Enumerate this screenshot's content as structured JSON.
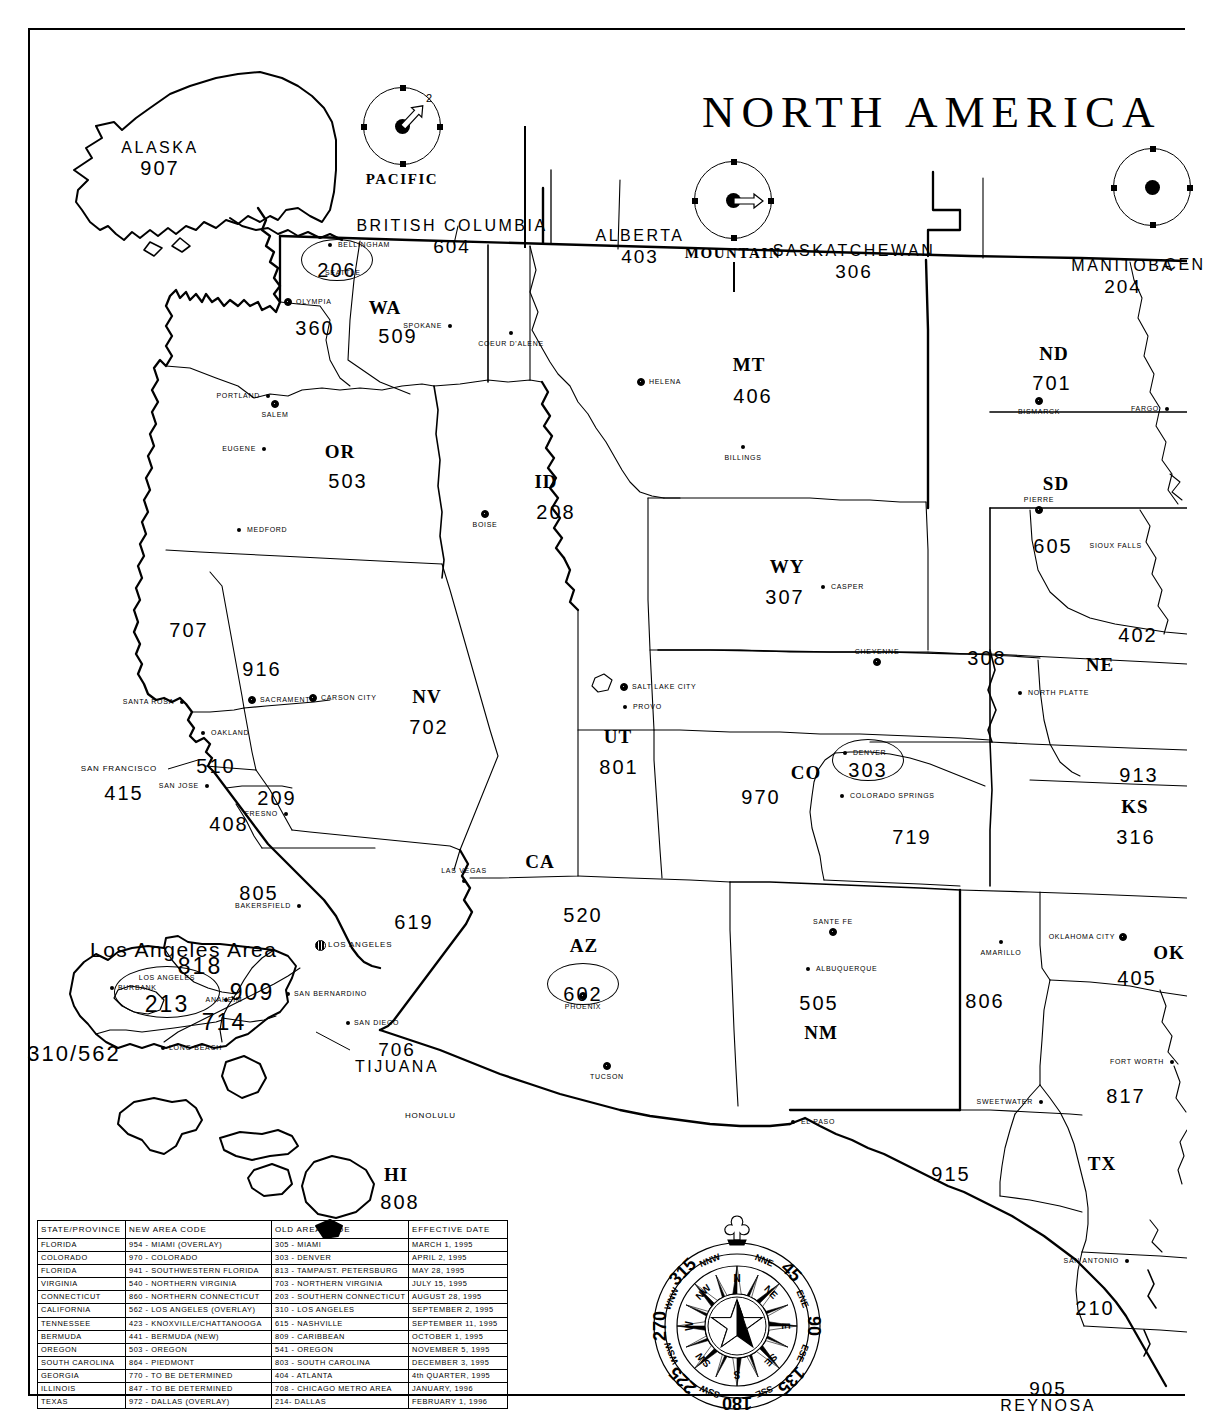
{
  "title": "NORTH AMERICA",
  "inset": {
    "title": "Los Angeles Area",
    "codes": [
      {
        "code": "818",
        "x": 170,
        "y": 924
      },
      {
        "code": "909",
        "x": 222,
        "y": 950
      },
      {
        "code": "213",
        "x": 137,
        "y": 962,
        "label": "LOS ANGELES"
      },
      {
        "code": "714",
        "x": 194,
        "y": 980,
        "label": "ANAHEIM"
      },
      {
        "code": "310/562",
        "x": 44,
        "y": 1012
      }
    ],
    "cities": [
      "BURBANK",
      "LOS ANGELES",
      "LONG BEACH",
      "ANAHEIM",
      "SAN BERNARDINO",
      "SAN DIEGO"
    ]
  },
  "timezones": [
    {
      "name": "PACIFIC",
      "hand": "2",
      "angle": -50
    },
    {
      "name": "MOUNTAIN",
      "hand": "",
      "angle": 0
    },
    {
      "name": "CENTRAL",
      "hand": "",
      "angle": 0
    }
  ],
  "compass": {
    "degrees": [
      "45",
      "90",
      "135",
      "180",
      "225",
      "270",
      "315"
    ],
    "cardinals": [
      "N",
      "NE",
      "E",
      "SE",
      "S",
      "SW",
      "W",
      "NW"
    ],
    "intercardinals": [
      "NNE",
      "ENE",
      "ESE",
      "SSE",
      "SSW",
      "WSW",
      "WNW",
      "NNW"
    ]
  },
  "states": [
    {
      "abbr": "WA",
      "code": "509",
      "ax": 355,
      "ay": 268,
      "cx": 368,
      "cy": 296
    },
    {
      "abbr": "",
      "code": "360",
      "cx": 285,
      "cy": 288
    },
    {
      "abbr": "",
      "code": "206",
      "cx": 307,
      "cy": 230,
      "oval": true,
      "label": "SEATTLE"
    },
    {
      "abbr": "OR",
      "code": "503",
      "ax": 310,
      "ay": 412,
      "cx": 318,
      "cy": 441
    },
    {
      "abbr": "ID",
      "code": "208",
      "ax": 516,
      "ay": 442,
      "cx": 526,
      "cy": 472
    },
    {
      "abbr": "MT",
      "code": "406",
      "ax": 719,
      "ay": 325,
      "cx": 723,
      "cy": 356
    },
    {
      "abbr": "WY",
      "code": "307",
      "ax": 757,
      "ay": 527,
      "cx": 755,
      "cy": 557
    },
    {
      "abbr": "ND",
      "code": "701",
      "ax": 1024,
      "ay": 314,
      "cx": 1022,
      "cy": 343
    },
    {
      "abbr": "SD",
      "code": "605",
      "ax": 1026,
      "ay": 444,
      "cx": 1023,
      "cy": 506
    },
    {
      "abbr": "NE",
      "code": "402",
      "ax": 1070,
      "ay": 625,
      "cx": 1108,
      "cy": 595
    },
    {
      "abbr": "",
      "code": "308",
      "cx": 957,
      "cy": 618
    },
    {
      "abbr": "KS",
      "code": "316",
      "ax": 1105,
      "ay": 767,
      "cx": 1106,
      "cy": 797
    },
    {
      "abbr": "",
      "code": "913",
      "cx": 1109,
      "cy": 735
    },
    {
      "abbr": "NV",
      "code": "702",
      "ax": 397,
      "ay": 657,
      "cx": 399,
      "cy": 687
    },
    {
      "abbr": "UT",
      "code": "801",
      "ax": 588,
      "ay": 697,
      "cx": 589,
      "cy": 727
    },
    {
      "abbr": "CO",
      "code": "303",
      "ax": 776,
      "ay": 733,
      "cx": 838,
      "cy": 730,
      "oval": true,
      "label": "DENVER"
    },
    {
      "abbr": "",
      "code": "970",
      "cx": 731,
      "cy": 757
    },
    {
      "abbr": "",
      "code": "719",
      "cx": 882,
      "cy": 797
    },
    {
      "abbr": "CA",
      "code": "",
      "ax": 510,
      "ay": 822
    },
    {
      "abbr": "",
      "code": "707",
      "cx": 159,
      "cy": 590
    },
    {
      "abbr": "",
      "code": "916",
      "cx": 232,
      "cy": 629
    },
    {
      "abbr": "",
      "code": "510",
      "cx": 186,
      "cy": 726
    },
    {
      "abbr": "",
      "code": "415",
      "cx": 94,
      "cy": 753
    },
    {
      "abbr": "",
      "code": "408",
      "cx": 199,
      "cy": 784
    },
    {
      "abbr": "",
      "code": "209",
      "cx": 247,
      "cy": 758
    },
    {
      "abbr": "",
      "code": "805",
      "cx": 229,
      "cy": 853
    },
    {
      "abbr": "",
      "code": "619",
      "cx": 384,
      "cy": 882
    },
    {
      "abbr": "AZ",
      "code": "520",
      "ax": 554,
      "ay": 906,
      "cx": 553,
      "cy": 875
    },
    {
      "abbr": "",
      "code": "602",
      "cx": 553,
      "cy": 954,
      "oval": true,
      "label": "PHOENIX"
    },
    {
      "abbr": "NM",
      "code": "505",
      "ax": 791,
      "ay": 993,
      "cx": 789,
      "cy": 963
    },
    {
      "abbr": "OK",
      "code": "405",
      "ax": 1139,
      "ay": 913,
      "cx": 1107,
      "cy": 938
    },
    {
      "abbr": "TX",
      "code": "817",
      "ax": 1072,
      "ay": 1124,
      "cx": 1096,
      "cy": 1056
    },
    {
      "abbr": "",
      "code": "806",
      "cx": 955,
      "cy": 961
    },
    {
      "abbr": "",
      "code": "915",
      "cx": 921,
      "cy": 1134
    },
    {
      "abbr": "",
      "code": "210",
      "cx": 1065,
      "cy": 1268
    },
    {
      "abbr": "HI",
      "code": "808",
      "ax": 366,
      "ay": 1135,
      "cx": 370,
      "cy": 1162
    },
    {
      "abbr": "",
      "code": "907",
      "cx": 130,
      "cy": 128,
      "statename": "ALASKA"
    }
  ],
  "provinces": [
    {
      "name": "BRITISH COLUMBIA",
      "code": "604",
      "x": 422,
      "y": 188
    },
    {
      "name": "ALBERTA",
      "code": "403",
      "x": 610,
      "y": 198
    },
    {
      "name": "SASKATCHEWAN",
      "code": "306",
      "x": 824,
      "y": 213
    },
    {
      "name": "MANITOBA",
      "code": "204",
      "x": 1093,
      "y": 228
    }
  ],
  "regions": [
    {
      "name": "ALASKA",
      "code": "907",
      "x": 130,
      "y": 110
    },
    {
      "name": "TIJUANA",
      "code": "706",
      "x": 367,
      "y": 1010
    },
    {
      "name": "REYNOSA",
      "code": "905",
      "x": 1018,
      "y": 1349
    },
    {
      "name": "CEN",
      "code": "",
      "x": 1155,
      "y": 227
    }
  ],
  "cities": [
    {
      "name": "BELLINGHAM",
      "x": 300,
      "y": 215,
      "type": "dot",
      "side": "right"
    },
    {
      "name": "SEATTLE",
      "x": 287,
      "y": 243,
      "type": "none",
      "side": "right"
    },
    {
      "name": "OLYMPIA",
      "x": 258,
      "y": 272,
      "type": "cap",
      "side": "right"
    },
    {
      "name": "SPOKANE",
      "x": 420,
      "y": 296,
      "type": "dot",
      "side": "left"
    },
    {
      "name": "COEUR D'ALENE",
      "x": 481,
      "y": 303,
      "type": "dot",
      "side": "below"
    },
    {
      "name": "PORTLAND",
      "x": 238,
      "y": 366,
      "type": "dot",
      "side": "left"
    },
    {
      "name": "SALEM",
      "x": 245,
      "y": 374,
      "type": "cap",
      "side": "below"
    },
    {
      "name": "EUGENE",
      "x": 234,
      "y": 419,
      "type": "dot",
      "side": "left"
    },
    {
      "name": "MEDFORD",
      "x": 209,
      "y": 500,
      "type": "dot",
      "side": "right"
    },
    {
      "name": "HELENA",
      "x": 611,
      "y": 352,
      "type": "cap",
      "side": "right"
    },
    {
      "name": "BILLINGS",
      "x": 713,
      "y": 417,
      "type": "dot",
      "side": "below"
    },
    {
      "name": "BOISE",
      "x": 455,
      "y": 484,
      "type": "cap",
      "side": "below"
    },
    {
      "name": "CASPER",
      "x": 793,
      "y": 557,
      "type": "dot",
      "side": "right"
    },
    {
      "name": "CHEYENNE",
      "x": 847,
      "y": 632,
      "type": "cap",
      "side": "above"
    },
    {
      "name": "BISMARCK",
      "x": 1009,
      "y": 371,
      "type": "cap",
      "side": "below"
    },
    {
      "name": "FARGO",
      "x": 1137,
      "y": 379,
      "type": "dot",
      "side": "left"
    },
    {
      "name": "PIERRE",
      "x": 1009,
      "y": 480,
      "type": "cap",
      "side": "above"
    },
    {
      "name": "SIOUX FALLS",
      "x": 1120,
      "y": 516,
      "type": "none",
      "side": "left"
    },
    {
      "name": "NORTH PLATTE",
      "x": 990,
      "y": 663,
      "type": "dot",
      "side": "right"
    },
    {
      "name": "SALT LAKE CITY",
      "x": 594,
      "y": 657,
      "type": "cap",
      "side": "right"
    },
    {
      "name": "PROVO",
      "x": 595,
      "y": 677,
      "type": "dot",
      "side": "right"
    },
    {
      "name": "SANTA ROSA",
      "x": 152,
      "y": 672,
      "type": "dot",
      "side": "left"
    },
    {
      "name": "SACRAMENTO",
      "x": 222,
      "y": 670,
      "type": "cap",
      "side": "right"
    },
    {
      "name": "CARSON CITY",
      "x": 283,
      "y": 668,
      "type": "cap",
      "side": "right"
    },
    {
      "name": "OAKLAND",
      "x": 173,
      "y": 703,
      "type": "dot",
      "side": "right"
    },
    {
      "name": "SAN FRANCISCO",
      "x": 135,
      "y": 739,
      "type": "none",
      "side": "left"
    },
    {
      "name": "SAN JOSE",
      "x": 177,
      "y": 756,
      "type": "dot",
      "side": "left"
    },
    {
      "name": "FRESNO",
      "x": 256,
      "y": 784,
      "type": "dot",
      "side": "left"
    },
    {
      "name": "BAKERSFIELD",
      "x": 269,
      "y": 876,
      "type": "dot",
      "side": "left"
    },
    {
      "name": "LAS VEGAS",
      "x": 434,
      "y": 851,
      "type": "dot",
      "side": "above"
    },
    {
      "name": "LOS ANGELES",
      "x": 290,
      "y": 915,
      "type": "big",
      "side": "right"
    },
    {
      "name": "DENVER",
      "x": 815,
      "y": 723,
      "type": "dot",
      "side": "right"
    },
    {
      "name": "COLORADO SPRINGS",
      "x": 812,
      "y": 766,
      "type": "dot",
      "side": "right"
    },
    {
      "name": "SANTE FE",
      "x": 803,
      "y": 902,
      "type": "cap",
      "side": "above"
    },
    {
      "name": "ALBUQUERQUE",
      "x": 778,
      "y": 939,
      "type": "dot",
      "side": "right"
    },
    {
      "name": "PHOENIX",
      "x": 553,
      "y": 966,
      "type": "cap",
      "side": "below"
    },
    {
      "name": "TUCSON",
      "x": 577,
      "y": 1036,
      "type": "cap",
      "side": "below"
    },
    {
      "name": "EL PASO",
      "x": 763,
      "y": 1092,
      "type": "dot",
      "side": "right"
    },
    {
      "name": "AMARILLO",
      "x": 971,
      "y": 912,
      "type": "dot",
      "side": "below"
    },
    {
      "name": "OKLAHOMA CITY",
      "x": 1093,
      "y": 907,
      "type": "cap",
      "side": "left"
    },
    {
      "name": "FORT WORTH",
      "x": 1142,
      "y": 1032,
      "type": "dot",
      "side": "left"
    },
    {
      "name": "SWEETWATER",
      "x": 1011,
      "y": 1072,
      "type": "dot",
      "side": "left"
    },
    {
      "name": "SAN ANTONIO",
      "x": 1097,
      "y": 1231,
      "type": "dot",
      "side": "left"
    },
    {
      "name": "HONOLULU",
      "x": 367,
      "y": 1086,
      "type": "none",
      "side": "right"
    }
  ],
  "legend": {
    "headers": [
      "STATE/PROVINCE",
      "NEW AREA CODE",
      "OLD AREA CODE",
      "EFFECTIVE DATE"
    ],
    "rows": [
      [
        "FLORIDA",
        "954 - MIAMI (OVERLAY)",
        "305 - MIAMI",
        "MARCH 1, 1995"
      ],
      [
        "COLORADO",
        "970 - COLORADO",
        "303 - DENVER",
        "APRIL 2, 1995"
      ],
      [
        "FLORIDA",
        "941 - SOUTHWESTERN FLORIDA",
        "813 - TAMPA/ST. PETERSBURG",
        "MAY 28, 1995"
      ],
      [
        "VIRGINIA",
        "540 - NORTHERN VIRGINIA",
        "703 - NORTHERN VIRGINIA",
        "JULY 15, 1995"
      ],
      [
        "CONNECTICUT",
        "860 - NORTHERN CONNECTICUT",
        "203 - SOUTHERN CONNECTICUT",
        "AUGUST 28, 1995"
      ],
      [
        "CALIFORNIA",
        "562 - LOS ANGELES (OVERLAY)",
        "310 - LOS ANGELES",
        "SEPTEMBER 2, 1995"
      ],
      [
        "TENNESSEE",
        "423 - KNOXVILLE/CHATTANOOGA",
        "615 - NASHVILLE",
        "SEPTEMBER 11, 1995"
      ],
      [
        "BERMUDA",
        "441 - BERMUDA (NEW)",
        "809 - CARIBBEAN",
        "OCTOBER 1, 1995"
      ],
      [
        "OREGON",
        "503 - OREGON",
        "541 - OREGON",
        "NOVEMBER 5, 1995"
      ],
      [
        "SOUTH CAROLINA",
        "864 - PIEDMONT",
        "803 - SOUTH CAROLINA",
        "DECEMBER 3, 1995"
      ],
      [
        "GEORGIA",
        "770 - TO BE DETERMINED",
        "404 - ATLANTA",
        "4th QUARTER, 1995"
      ],
      [
        "ILLINOIS",
        "847 - TO BE DETERMINED",
        "708 - CHICAGO METRO AREA",
        "JANUARY, 1996"
      ],
      [
        "TEXAS",
        "972 - DALLAS (OVERLAY)",
        "214- DALLAS",
        "FEBRUARY 1, 1996"
      ]
    ]
  }
}
